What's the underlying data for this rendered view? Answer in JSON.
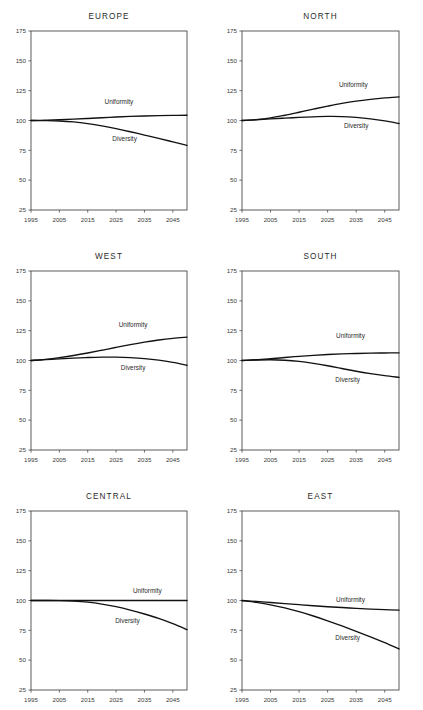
{
  "figure": {
    "panel_count": 6,
    "series_names": [
      "Uniformity",
      "Diversity"
    ],
    "axis": {
      "y_ticks": [
        175,
        150,
        125,
        100,
        75,
        50,
        25
      ],
      "x_ticks": [
        1995,
        2005,
        2015,
        2025,
        2035,
        2045
      ],
      "ylim": [
        25,
        175
      ],
      "xlim": [
        1995,
        2050
      ],
      "grid": false
    },
    "line_color": "#111111",
    "frame_color": "#4a4a4a",
    "background": "#ffffff"
  },
  "chart_data": [
    {
      "type": "line",
      "title": "EUROPE",
      "xlabel": "",
      "ylabel": "",
      "xlim": [
        1995,
        2050
      ],
      "ylim": [
        25,
        175
      ],
      "grid": false,
      "legend": "inline-labels",
      "x": [
        1995,
        2000,
        2005,
        2010,
        2015,
        2020,
        2025,
        2030,
        2035,
        2040,
        2045,
        2050
      ],
      "series": [
        {
          "name": "Uniformity",
          "values": [
            100,
            100.2,
            100.6,
            101.1,
            101.7,
            102.3,
            102.9,
            103.4,
            103.8,
            104.1,
            104.3,
            104.4
          ],
          "label_x": 2026,
          "label_y": 114
        },
        {
          "name": "Diversity",
          "values": [
            100,
            99.9,
            99.6,
            98.8,
            97.4,
            95.5,
            93.2,
            90.6,
            87.8,
            85.0,
            82.1,
            79.2
          ],
          "label_x": 2028,
          "label_y": 83
        }
      ]
    },
    {
      "type": "line",
      "title": "NORTH",
      "xlabel": "",
      "ylabel": "",
      "xlim": [
        1995,
        2050
      ],
      "ylim": [
        25,
        175
      ],
      "grid": false,
      "legend": "inline-labels",
      "x": [
        1995,
        2000,
        2005,
        2010,
        2015,
        2020,
        2025,
        2030,
        2035,
        2040,
        2045,
        2050
      ],
      "series": [
        {
          "name": "Uniformity",
          "values": [
            100,
            100.8,
            102.2,
            104.4,
            106.9,
            109.5,
            112.0,
            114.3,
            116.2,
            117.7,
            118.9,
            119.8
          ],
          "label_x": 2034,
          "label_y": 128
        },
        {
          "name": "Diversity",
          "values": [
            100,
            100.6,
            101.3,
            102.0,
            102.6,
            103.1,
            103.4,
            103.3,
            102.6,
            101.4,
            99.7,
            97.5
          ],
          "label_x": 2035,
          "label_y": 94
        }
      ]
    },
    {
      "type": "line",
      "title": "WEST",
      "xlabel": "",
      "ylabel": "",
      "xlim": [
        1995,
        2050
      ],
      "ylim": [
        25,
        175
      ],
      "grid": false,
      "legend": "inline-labels",
      "x": [
        1995,
        2000,
        2005,
        2010,
        2015,
        2020,
        2025,
        2030,
        2035,
        2040,
        2045,
        2050
      ],
      "series": [
        {
          "name": "Uniformity",
          "values": [
            100,
            101.0,
            102.4,
            104.2,
            106.3,
            108.6,
            111.0,
            113.3,
            115.4,
            117.2,
            118.6,
            119.6
          ],
          "label_x": 2031,
          "label_y": 128
        },
        {
          "name": "Diversity",
          "values": [
            100,
            100.7,
            101.4,
            102.0,
            102.5,
            102.8,
            102.8,
            102.4,
            101.6,
            100.3,
            98.4,
            96.0
          ],
          "label_x": 2031,
          "label_y": 92
        }
      ]
    },
    {
      "type": "line",
      "title": "SOUTH",
      "xlabel": "",
      "ylabel": "",
      "xlim": [
        1995,
        2050
      ],
      "ylim": [
        25,
        175
      ],
      "grid": false,
      "legend": "inline-labels",
      "x": [
        1995,
        2000,
        2005,
        2010,
        2015,
        2020,
        2025,
        2030,
        2035,
        2040,
        2045,
        2050
      ],
      "series": [
        {
          "name": "Uniformity",
          "values": [
            100,
            100.6,
            101.5,
            102.5,
            103.5,
            104.3,
            105.0,
            105.5,
            105.9,
            106.2,
            106.3,
            106.4
          ],
          "label_x": 2033,
          "label_y": 119
        },
        {
          "name": "Diversity",
          "values": [
            100,
            100.4,
            100.6,
            100.2,
            99.2,
            97.6,
            95.6,
            93.3,
            91.0,
            89.0,
            87.3,
            85.9
          ],
          "label_x": 2032,
          "label_y": 82
        }
      ]
    },
    {
      "type": "line",
      "title": "CENTRAL",
      "xlabel": "",
      "ylabel": "",
      "xlim": [
        1995,
        2050
      ],
      "ylim": [
        25,
        175
      ],
      "grid": false,
      "legend": "inline-labels",
      "x": [
        1995,
        2000,
        2005,
        2010,
        2015,
        2020,
        2025,
        2030,
        2035,
        2040,
        2045,
        2050
      ],
      "series": [
        {
          "name": "Uniformity",
          "values": [
            100,
            100,
            100,
            100,
            100,
            100,
            100,
            100,
            100,
            100,
            100,
            100
          ],
          "label_x": 2036,
          "label_y": 106
        },
        {
          "name": "Diversity",
          "values": [
            100,
            100,
            99.9,
            99.5,
            98.6,
            97.0,
            94.8,
            92.0,
            88.7,
            85.0,
            80.6,
            75.6
          ],
          "label_x": 2029,
          "label_y": 81
        }
      ]
    },
    {
      "type": "line",
      "title": "EAST",
      "xlabel": "",
      "ylabel": "",
      "xlim": [
        1995,
        2050
      ],
      "ylim": [
        25,
        175
      ],
      "grid": false,
      "legend": "inline-labels",
      "x": [
        1995,
        2000,
        2005,
        2010,
        2015,
        2020,
        2025,
        2030,
        2035,
        2040,
        2045,
        2050
      ],
      "series": [
        {
          "name": "Uniformity",
          "values": [
            100,
            99.2,
            98.3,
            97.4,
            96.5,
            95.6,
            94.8,
            94.1,
            93.4,
            92.8,
            92.3,
            91.9
          ],
          "label_x": 2033,
          "label_y": 99
        },
        {
          "name": "Diversity",
          "values": [
            100,
            98.4,
            96.4,
            93.8,
            90.6,
            87.0,
            83.0,
            78.7,
            74.2,
            69.5,
            64.6,
            59.4
          ],
          "label_x": 2032,
          "label_y": 67
        }
      ]
    }
  ]
}
